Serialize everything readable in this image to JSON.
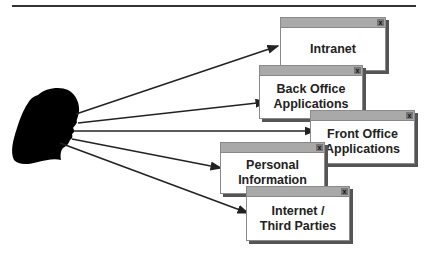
{
  "diagram": {
    "title_fragment": "",
    "actor": {
      "name": "user-silhouette"
    },
    "targets": [
      {
        "id": "intranet",
        "lines": [
          "Intranet"
        ]
      },
      {
        "id": "back-office",
        "lines": [
          "Back Office",
          "Applications"
        ]
      },
      {
        "id": "front-office",
        "lines": [
          "Front Office",
          "Applications"
        ]
      },
      {
        "id": "personal-info",
        "lines": [
          "Personal",
          "Information"
        ]
      },
      {
        "id": "internet",
        "lines": [
          "Internet /",
          "Third Parties"
        ]
      }
    ],
    "window_close_glyph": "x",
    "colors": {
      "titlebar": "#a9a9a9",
      "shadow": "#555555",
      "silhouette": "#000000",
      "arrow": "#222222"
    }
  }
}
